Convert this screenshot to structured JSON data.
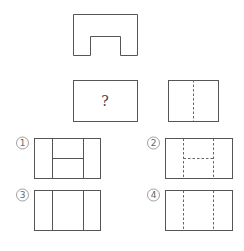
{
  "colors": {
    "background": "#ffffff",
    "line": "#555555",
    "dashed_line": "#666666"
  },
  "top_view": {
    "outline_points": [
      [
        73,
        14
      ],
      [
        137,
        14
      ],
      [
        137,
        55
      ],
      [
        120,
        55
      ],
      [
        120,
        36
      ],
      [
        90,
        36
      ],
      [
        90,
        55
      ],
      [
        73,
        55
      ]
    ]
  },
  "front_view": {
    "rect": {
      "x": 73,
      "y": 80,
      "w": 64,
      "h": 41
    },
    "label": "?"
  },
  "side_view": {
    "rect": {
      "x": 168,
      "y": 80,
      "w": 50,
      "h": 41
    },
    "dashed_lines": [
      [
        193,
        80,
        193,
        121
      ]
    ]
  },
  "options": [
    {
      "number": "1",
      "label": "①",
      "label_pos": {
        "x": 22.5,
        "y": 143
      },
      "rect": {
        "x": 34,
        "y": 138,
        "w": 66,
        "h": 40
      },
      "solid_lines": [
        [
          52,
          138,
          52,
          178
        ],
        [
          83,
          138,
          83,
          178
        ],
        [
          52,
          158,
          83,
          158
        ]
      ],
      "dashed_lines": []
    },
    {
      "number": "2",
      "label": "②",
      "label_pos": {
        "x": 153.5,
        "y": 143
      },
      "rect": {
        "x": 165,
        "y": 138,
        "w": 67,
        "h": 40
      },
      "solid_lines": [],
      "dashed_lines": [
        [
          183,
          138,
          183,
          178
        ],
        [
          213,
          138,
          213,
          178
        ],
        [
          183,
          158,
          213,
          158
        ]
      ]
    },
    {
      "number": "3",
      "label": "③",
      "label_pos": {
        "x": 22.5,
        "y": 195
      },
      "rect": {
        "x": 34,
        "y": 190,
        "w": 66,
        "h": 40
      },
      "solid_lines": [
        [
          52,
          190,
          52,
          230
        ],
        [
          83,
          190,
          83,
          230
        ]
      ],
      "dashed_lines": []
    },
    {
      "number": "4",
      "label": "④",
      "label_pos": {
        "x": 153.5,
        "y": 195
      },
      "rect": {
        "x": 165,
        "y": 190,
        "w": 67,
        "h": 40
      },
      "solid_lines": [],
      "dashed_lines": [
        [
          183,
          190,
          183,
          230
        ],
        [
          213,
          190,
          213,
          230
        ]
      ]
    }
  ]
}
